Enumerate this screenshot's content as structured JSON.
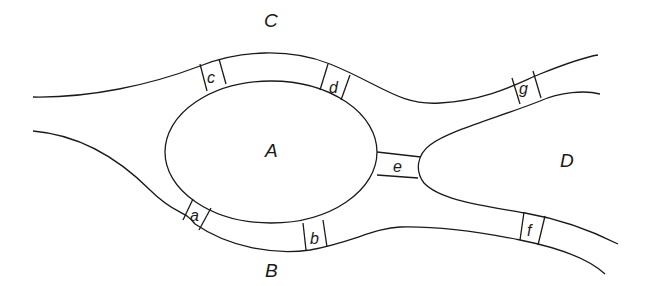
{
  "diagram": {
    "kind": "Seven Bridges of Königsberg map",
    "land_masses": [
      {
        "id": "A",
        "label": "A"
      },
      {
        "id": "B",
        "label": "B"
      },
      {
        "id": "C",
        "label": "C"
      },
      {
        "id": "D",
        "label": "D"
      }
    ],
    "bridges": [
      {
        "id": "a",
        "label": "a",
        "connects": [
          "A",
          "B"
        ]
      },
      {
        "id": "b",
        "label": "b",
        "connects": [
          "A",
          "B"
        ]
      },
      {
        "id": "c",
        "label": "c",
        "connects": [
          "A",
          "C"
        ]
      },
      {
        "id": "d",
        "label": "d",
        "connects": [
          "A",
          "C"
        ]
      },
      {
        "id": "e",
        "label": "e",
        "connects": [
          "A",
          "D"
        ]
      },
      {
        "id": "f",
        "label": "f",
        "connects": [
          "B",
          "D"
        ]
      },
      {
        "id": "g",
        "label": "g",
        "connects": [
          "C",
          "D"
        ]
      }
    ],
    "colors": {
      "ink": "#1a1a1a",
      "background": "#ffffff"
    }
  }
}
